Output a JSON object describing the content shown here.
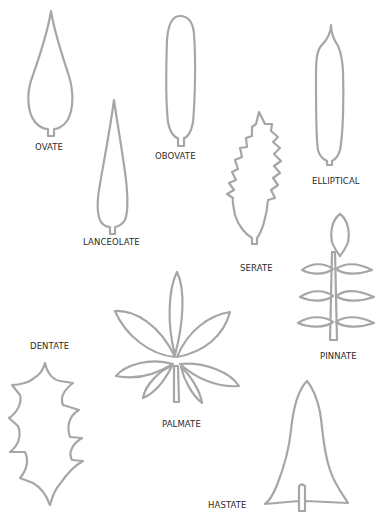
{
  "diagram": {
    "stroke_color": "#a6a6a6",
    "text_color": "#2b2b2b",
    "leaves": [
      {
        "id": "ovate",
        "label": "OVATE"
      },
      {
        "id": "obovate",
        "label": "OBOVATE"
      },
      {
        "id": "lanceolate",
        "label": "LANCEOLATE"
      },
      {
        "id": "elliptical",
        "label": "ELLIPTICAL"
      },
      {
        "id": "serate",
        "label": "SERATE"
      },
      {
        "id": "pinnate",
        "label": "PINNATE"
      },
      {
        "id": "dentate",
        "label": "DENTATE"
      },
      {
        "id": "palmate",
        "label": "PALMATE"
      },
      {
        "id": "hastate",
        "label": "HASTATE"
      }
    ]
  }
}
